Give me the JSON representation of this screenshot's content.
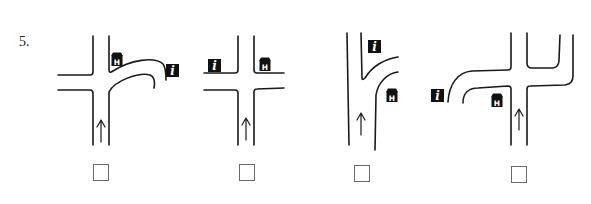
{
  "question": {
    "number": "5."
  },
  "options": [
    {
      "id": 1,
      "description": "T-junction: left road branches off; curved road to the right leads to info sign; hotel sign at top-right corner",
      "icons": [
        "hotel-icon",
        "info-icon"
      ],
      "direction": "up",
      "checked": false
    },
    {
      "id": 2,
      "description": "Four-way crossroads: info sign top-left corner, hotel sign top-right corner",
      "icons": [
        "info-icon",
        "hotel-icon"
      ],
      "direction": "up",
      "checked": false
    },
    {
      "id": 3,
      "description": "Road continues straight with a branch curving off to the right; info sign above branch, hotel sign below branch",
      "icons": [
        "info-icon",
        "hotel-icon"
      ],
      "direction": "up",
      "checked": false
    },
    {
      "id": 4,
      "description": "Crossroads with curved left road leading to info sign and right road turning up; hotel sign at bottom-left corner",
      "icons": [
        "info-icon",
        "hotel-icon"
      ],
      "direction": "up",
      "checked": false
    }
  ],
  "icons": {
    "info_glyph": "i",
    "hotel_glyph": "H"
  },
  "colors": {
    "line": "#1a1a1a",
    "icon_bg": "#111111",
    "icon_fg": "#ffffff",
    "checkbox_border": "#6a6a6a"
  }
}
